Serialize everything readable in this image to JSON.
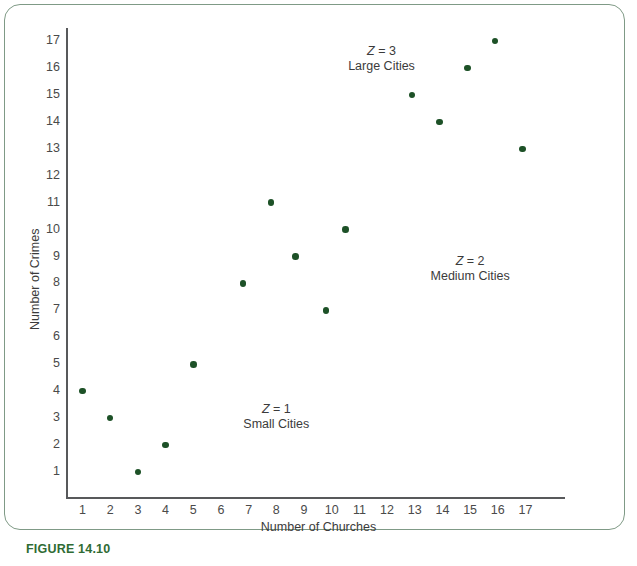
{
  "figure": {
    "caption": "FIGURE 14.10",
    "caption_color": "#2f6b34",
    "frame_color": "#7f9a86"
  },
  "chart_data": {
    "type": "scatter",
    "title": "",
    "xlabel": "Number of Churches",
    "ylabel": "Number of Crimes",
    "xlim": [
      0,
      17.8
    ],
    "ylim": [
      0,
      17.8
    ],
    "grid": false,
    "legend": "none",
    "marker_color": "#1d5127",
    "xticks": [
      1,
      2,
      3,
      4,
      5,
      6,
      7,
      8,
      9,
      10,
      11,
      12,
      13,
      14,
      15,
      16,
      17
    ],
    "yticks": [
      1,
      2,
      3,
      4,
      5,
      6,
      7,
      8,
      9,
      10,
      11,
      12,
      13,
      14,
      15,
      16,
      17
    ],
    "points": [
      {
        "x": 1,
        "y": 4,
        "group": "Small Cities"
      },
      {
        "x": 2,
        "y": 3,
        "group": "Small Cities"
      },
      {
        "x": 3,
        "y": 1,
        "group": "Small Cities"
      },
      {
        "x": 4,
        "y": 2,
        "group": "Small Cities"
      },
      {
        "x": 5,
        "y": 5,
        "group": "Small Cities"
      },
      {
        "x": 6.8,
        "y": 8,
        "group": "Medium Cities"
      },
      {
        "x": 7.8,
        "y": 11,
        "group": "Medium Cities"
      },
      {
        "x": 8.7,
        "y": 9,
        "group": "Medium Cities"
      },
      {
        "x": 9.8,
        "y": 7,
        "group": "Medium Cities"
      },
      {
        "x": 10.5,
        "y": 10,
        "group": "Medium Cities"
      },
      {
        "x": 12.9,
        "y": 15,
        "group": "Large Cities"
      },
      {
        "x": 13.9,
        "y": 14,
        "group": "Large Cities"
      },
      {
        "x": 14.9,
        "y": 16,
        "group": "Large Cities"
      },
      {
        "x": 15.9,
        "y": 17,
        "group": "Large Cities"
      },
      {
        "x": 16.9,
        "y": 13,
        "group": "Large Cities"
      }
    ],
    "annotations": [
      {
        "id": "z3",
        "z_prefix": "Z",
        "z_value": " = 3",
        "name": "Large Cities",
        "x": 11.8,
        "y": 16.6
      },
      {
        "id": "z2",
        "z_prefix": "Z",
        "z_value": " = 2",
        "name": "Medium Cities",
        "x": 15.0,
        "y": 8.8
      },
      {
        "id": "z1",
        "z_prefix": "Z",
        "z_value": " = 1",
        "name": "Small Cities",
        "x": 8.0,
        "y": 3.3
      }
    ]
  }
}
